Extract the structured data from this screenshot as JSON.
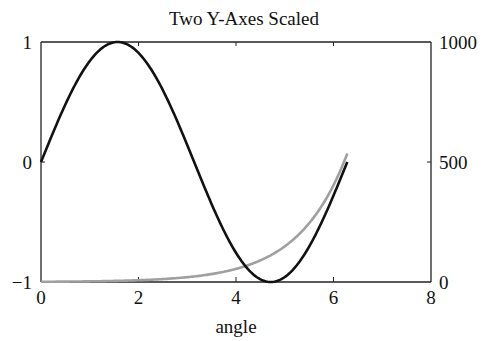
{
  "chart_data": {
    "type": "line",
    "title": "Two Y-Axes Scaled",
    "xlabel": "angle",
    "ylabel_left": "",
    "ylabel_right": "",
    "xlim": [
      0,
      8
    ],
    "ylim_left": [
      -1,
      1
    ],
    "ylim_right": [
      0,
      1000
    ],
    "x_ticks": [
      "0",
      "2",
      "4",
      "6",
      "8"
    ],
    "y_left_ticks": [
      "-1",
      "0",
      "1"
    ],
    "y_right_ticks": [
      "0",
      "500",
      "1000"
    ],
    "grid": false,
    "legend": null,
    "series": [
      {
        "name": "sin(angle)",
        "axis": "left",
        "color": "#111111",
        "x_range": [
          0,
          6.2832
        ],
        "function": "sin(x)",
        "sample_points": [
          [
            0,
            0
          ],
          [
            0.785,
            0.707
          ],
          [
            1.571,
            1
          ],
          [
            2.356,
            0.707
          ],
          [
            3.142,
            0
          ],
          [
            3.927,
            -0.707
          ],
          [
            4.712,
            -1
          ],
          [
            5.498,
            -0.707
          ],
          [
            6.283,
            0
          ]
        ]
      },
      {
        "name": "exp(angle)",
        "axis": "right",
        "color": "#999999",
        "x_range": [
          0,
          6.2832
        ],
        "function": "exp(x)",
        "sample_points": [
          [
            0,
            1
          ],
          [
            1,
            2.7
          ],
          [
            2,
            7.4
          ],
          [
            3,
            20.1
          ],
          [
            4,
            54.6
          ],
          [
            5,
            148.4
          ],
          [
            6,
            403.4
          ],
          [
            6.283,
            535.5
          ]
        ]
      }
    ]
  },
  "labels": {
    "title": "Two Y-Axes Scaled",
    "xlabel": "angle",
    "x_ticks": [
      "0",
      "2",
      "4",
      "6",
      "8"
    ],
    "y_left": {
      "top": "1",
      "mid": "0",
      "bottom": "−1"
    },
    "y_right": {
      "top": "1000",
      "mid": "500",
      "bottom": "0"
    }
  }
}
